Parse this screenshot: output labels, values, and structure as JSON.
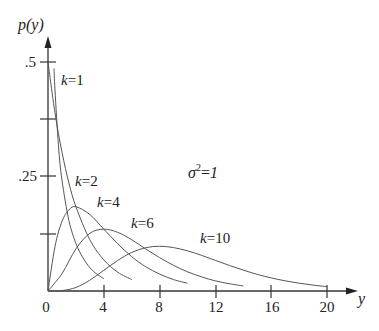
{
  "chart_data": {
    "type": "line",
    "title": "",
    "xlabel": "y",
    "ylabel": "p(y)",
    "xlim": [
      0,
      20
    ],
    "ylim": [
      0,
      0.5
    ],
    "x_ticks": [
      0,
      4,
      8,
      12,
      16,
      20
    ],
    "x_tick_labels": [
      "0",
      "4",
      "8",
      "12",
      "16",
      "20"
    ],
    "y_ticks": [
      0.125,
      0.25,
      0.375,
      0.5
    ],
    "y_tick_labels": [
      "",
      ".25",
      "",
      ".5"
    ],
    "grid": false,
    "annotation": "σ²=1",
    "series": [
      {
        "name": "k=1",
        "label": "k=1",
        "x": [
          0.43,
          0.5,
          0.75,
          1,
          1.5,
          2,
          2.5,
          3,
          3.5,
          4
        ],
        "y": [
          0.486,
          0.439,
          0.317,
          0.242,
          0.154,
          0.104,
          0.073,
          0.051,
          0.037,
          0.027
        ]
      },
      {
        "name": "k=2",
        "label": "k=2",
        "x": [
          0,
          0.5,
          1,
          1.5,
          2,
          3,
          4,
          5,
          6
        ],
        "y": [
          0.5,
          0.389,
          0.303,
          0.236,
          0.184,
          0.112,
          0.068,
          0.041,
          0.025
        ]
      },
      {
        "name": "k=4",
        "label": "k=4",
        "x": [
          0,
          0.5,
          1,
          1.5,
          2,
          3,
          4,
          5,
          6,
          7,
          8,
          9,
          10
        ],
        "y": [
          0,
          0.097,
          0.152,
          0.177,
          0.184,
          0.167,
          0.135,
          0.103,
          0.075,
          0.053,
          0.037,
          0.025,
          0.017
        ]
      },
      {
        "name": "k=6",
        "label": "k=6",
        "x": [
          0,
          1,
          2,
          3,
          4,
          5,
          6,
          7,
          8,
          9,
          10,
          11,
          12,
          13,
          14
        ],
        "y": [
          0,
          0.038,
          0.092,
          0.126,
          0.135,
          0.128,
          0.112,
          0.092,
          0.073,
          0.056,
          0.042,
          0.031,
          0.022,
          0.016,
          0.011
        ]
      },
      {
        "name": "k=10",
        "label": "k=10",
        "x": [
          0,
          1,
          2,
          3,
          4,
          5,
          6,
          7,
          8,
          9,
          10,
          11,
          12,
          13,
          14,
          15,
          16,
          17,
          18,
          19,
          20
        ],
        "y": [
          0,
          0.0008,
          0.0077,
          0.0235,
          0.0451,
          0.0668,
          0.084,
          0.0944,
          0.0977,
          0.0947,
          0.0877,
          0.0779,
          0.0669,
          0.0559,
          0.0456,
          0.0363,
          0.0286,
          0.0222,
          0.017,
          0.0129,
          0.0096
        ]
      }
    ]
  },
  "labels": {
    "ylabel": "p(y)",
    "xlabel": "y",
    "annotation_sigma": "σ",
    "annotation_sup": "2",
    "annotation_rest": "=",
    "annotation_val": "1",
    "ytick_05": ".5",
    "ytick_025": ".25",
    "k_prefix": "k",
    "k1": "=1",
    "k2": "=2",
    "k4": "=4",
    "k6": "=6",
    "k10": "=10",
    "x0": "0",
    "x4": "4",
    "x8": "8",
    "x12": "12",
    "x16": "16",
    "x20": "20"
  }
}
